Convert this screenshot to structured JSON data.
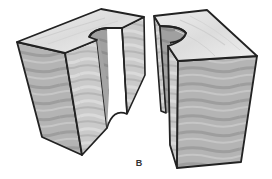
{
  "figure": {
    "label": "B",
    "colors": {
      "outline": "#222222",
      "top_face": "#e4e4e4",
      "front_face": "#b2b2b2",
      "side_face": "#c8c8c8",
      "notch_inner": "#9a9a9a",
      "grain_dark": "#9c9c9c",
      "grain_light": "#d6d6d6",
      "background": "#ffffff"
    }
  }
}
